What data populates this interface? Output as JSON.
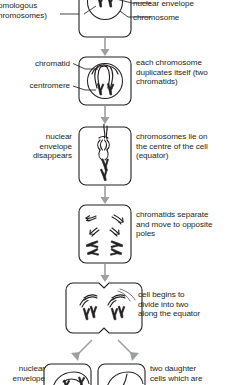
{
  "figure": {
    "line_color": "#231f20",
    "arrow_color": "#9c9e9f",
    "background": "#ffffff"
  },
  "labels": {
    "homologous_pair": "omologous\nhromosomes)",
    "nuclear_envelope": "nuclear envelope",
    "chromosome": "chromosome",
    "chromatid": "chromatid",
    "centromere": "centromere",
    "duplication": "each chromosome\nduplicates itself (two\nchromatids)",
    "envelope_disappears": "nuclear\nenvelope\ndisappears",
    "equator": "chromosomes lie on\nthe centre of the cell\n(equator)",
    "separation": "chromatids separate\nand move to opposite\npoles",
    "division": "cell begins to\ndivide into two\nalong the equator",
    "envelope_reforms": "nuclear\nenvelope",
    "daughter_cells": "two daughter\ncells which are"
  },
  "stages": [
    {
      "id": "stage-1-interphase",
      "caption": "nuclear envelope"
    },
    {
      "id": "stage-2-duplication",
      "caption": "each chromosome duplicates itself (two chromatids)"
    },
    {
      "id": "stage-3-metaphase",
      "caption": "chromosomes lie on the centre of the cell (equator)"
    },
    {
      "id": "stage-4-anaphase",
      "caption": "chromatids separate and move to opposite poles"
    },
    {
      "id": "stage-5-telophase",
      "caption": "cell begins to divide into two along the equator"
    },
    {
      "id": "stage-6-daughter-cells",
      "caption": "two daughter cells which are"
    }
  ]
}
